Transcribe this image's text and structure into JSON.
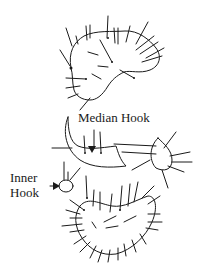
{
  "figure": {
    "labels": {
      "median_hook": "Median Hook",
      "inner_hook": "Inner Hook"
    },
    "colors": {
      "ink": "#1a1a1a",
      "background": "#ffffff"
    }
  }
}
